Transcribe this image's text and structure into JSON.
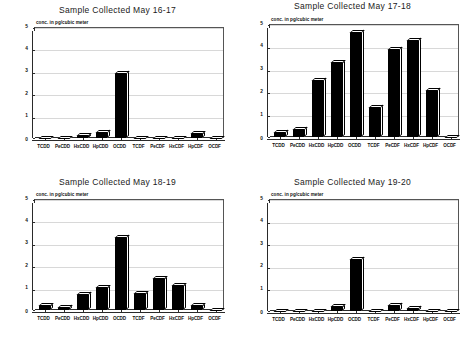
{
  "figure": {
    "background": "#ffffff",
    "axis_color": "#2a2a2a",
    "bar_color": "#000000",
    "bar_highlight": "#ffffff",
    "gridline_color": "#d8d8d8"
  },
  "chart_data": [
    {
      "type": "bar",
      "title": "Sample Collected May 16-17",
      "ylabel": "conc. in pg/cubic meter",
      "xlabel": "",
      "categories": [
        "TCDD",
        "PeCDD",
        "HxCDD",
        "HpCDD",
        "OCDD",
        "TCDF",
        "PeCDF",
        "HxCDF",
        "HpCDF",
        "OCDF"
      ],
      "values": [
        0,
        0,
        0.1,
        0.25,
        2.9,
        0,
        0,
        0,
        0.2,
        0
      ],
      "ylim": [
        0,
        5
      ],
      "yticks": [
        0,
        1,
        2,
        3,
        4,
        5
      ],
      "grid": true,
      "legend": "none"
    },
    {
      "type": "bar",
      "title": "Sample Collected May 17-18",
      "ylabel": "conc. in pg/cubic meter",
      "xlabel": "",
      "categories": [
        "TCDD",
        "PeCDD",
        "HxCDD",
        "HpCDD",
        "OCDD",
        "TCDF",
        "PeCDF",
        "HxCDF",
        "HpCDF",
        "OCDF"
      ],
      "values": [
        0.2,
        0.35,
        2.5,
        3.25,
        4.6,
        1.3,
        3.85,
        4.25,
        2.05,
        0
      ],
      "ylim": [
        0,
        5
      ],
      "yticks": [
        0,
        1,
        2,
        3,
        4,
        5
      ],
      "grid": true,
      "legend": "none"
    },
    {
      "type": "bar",
      "title": "Sample Collected May 18-19",
      "ylabel": "conc. in pg/cubic meter",
      "xlabel": "",
      "categories": [
        "TCDD",
        "PeCDD",
        "HxCDD",
        "HpCDD",
        "OCDD",
        "TCDF",
        "PeCDF",
        "HxCDF",
        "HpCDF",
        "OCDF"
      ],
      "values": [
        0.2,
        0.12,
        0.7,
        1.0,
        3.25,
        0.72,
        1.4,
        1.08,
        0.2,
        0
      ],
      "ylim": [
        0,
        5
      ],
      "yticks": [
        0,
        1,
        2,
        3,
        4,
        5
      ],
      "grid": true,
      "legend": "none"
    },
    {
      "type": "bar",
      "title": "Sample Collected May 19-20",
      "ylabel": "conc. in pg/cubic meter",
      "xlabel": "",
      "categories": [
        "TCDD",
        "PeCDD",
        "HxCDD",
        "HpCDD",
        "OCDD",
        "TCDF",
        "PeCDF",
        "HxCDF",
        "HpCDF",
        "OCDF"
      ],
      "values": [
        0,
        0,
        0,
        0.18,
        2.3,
        0,
        0.25,
        0.12,
        0,
        0
      ],
      "ylim": [
        0,
        5
      ],
      "yticks": [
        0,
        1,
        2,
        3,
        4,
        5
      ],
      "grid": true,
      "legend": "none"
    }
  ]
}
